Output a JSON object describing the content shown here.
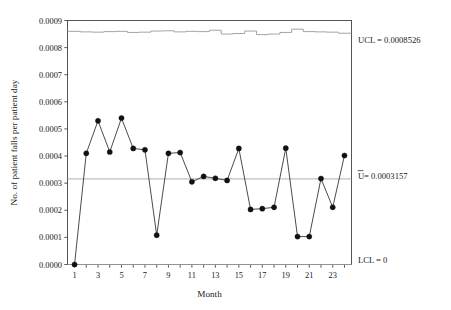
{
  "chart_data": {
    "type": "line",
    "title": "",
    "subtitle": "",
    "xlabel": "Month",
    "ylabel": "No. of patient falls per patient day",
    "x": [
      1,
      2,
      3,
      4,
      5,
      6,
      7,
      8,
      9,
      10,
      11,
      12,
      13,
      14,
      15,
      16,
      17,
      18,
      19,
      20,
      21,
      22,
      23,
      24
    ],
    "values": [
      0.0,
      0.00041,
      0.00053,
      0.000415,
      0.00054,
      0.000428,
      0.000423,
      0.000108,
      0.00041,
      0.000413,
      0.000305,
      0.000325,
      0.000318,
      0.00031,
      0.000428,
      0.000203,
      0.000206,
      0.000211,
      0.000429,
      0.000103,
      0.000103,
      0.000317,
      0.000211,
      0.000402
    ],
    "series": [
      {
        "name": "No. of patient falls per patient day",
        "values": [
          0.0,
          0.00041,
          0.00053,
          0.000415,
          0.00054,
          0.000428,
          0.000423,
          0.000108,
          0.00041,
          0.000413,
          0.000305,
          0.000325,
          0.000318,
          0.00031,
          0.000428,
          0.000203,
          0.000206,
          0.000211,
          0.000429,
          0.000103,
          0.000103,
          0.000317,
          0.000211,
          0.000402
        ]
      }
    ],
    "control_limits": {
      "ucl_label": "UCL = 0.0008526",
      "ucl_value": 0.0008526,
      "ucl_values": [
        0.00086,
        0.000858,
        0.000857,
        0.000859,
        0.00086,
        0.000856,
        0.000857,
        0.000861,
        0.000862,
        0.000858,
        0.00086,
        0.000859,
        0.000864,
        0.00085,
        0.000852,
        0.000861,
        0.000848,
        0.00085,
        0.000856,
        0.000868,
        0.000859,
        0.000858,
        0.000857,
        0.000853
      ],
      "center_label": "U = 0.0003157",
      "center_label_prefix": "U",
      "center_label_suffix": " = 0.0003157",
      "center_value": 0.0003157,
      "lcl_label": "LCL = 0",
      "lcl_value": 0
    },
    "ylim": [
      0.0,
      0.0009
    ],
    "xlim": [
      0.4,
      24.6
    ],
    "ytick_labels": [
      "0.0000",
      "0.0001",
      "0.0002",
      "0.0003",
      "0.0004",
      "0.0005",
      "0.0006",
      "0.0007",
      "0.0008",
      "0.0009"
    ],
    "ytick_values": [
      0.0,
      0.0001,
      0.0002,
      0.0003,
      0.0004,
      0.0005,
      0.0006,
      0.0007,
      0.0008,
      0.0009
    ],
    "xtick_labels": [
      "1",
      "3",
      "5",
      "7",
      "9",
      "11",
      "13",
      "15",
      "17",
      "19",
      "21",
      "23"
    ],
    "xtick_values": [
      1,
      3,
      5,
      7,
      9,
      11,
      13,
      15,
      17,
      19,
      21,
      23
    ],
    "grid": false,
    "legend": "none",
    "marker": "filled-circle",
    "colors": {
      "series": "#2a2a2a",
      "marker": "#111111",
      "limits": "#9a9a9a",
      "frame": "#444444",
      "text": "#1a1a1a",
      "background": "#ffffff"
    }
  }
}
